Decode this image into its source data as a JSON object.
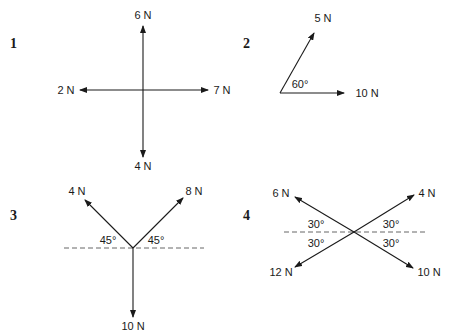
{
  "diagrams": [
    {
      "number": "1",
      "forces": {
        "up": "6 N",
        "left": "2 N",
        "right": "7 N",
        "down": "4 N"
      }
    },
    {
      "number": "2",
      "forces": {
        "angled": "5 N",
        "horizontal": "10 N"
      },
      "angle": "60°"
    },
    {
      "number": "3",
      "forces": {
        "upper_left": "4 N",
        "upper_right": "8 N",
        "down": "10 N"
      },
      "angles": {
        "left": "45°",
        "right": "45°"
      }
    },
    {
      "number": "4",
      "forces": {
        "upper_left": "6 N",
        "upper_right": "4 N",
        "lower_left": "12 N",
        "lower_right": "10 N"
      },
      "angles": {
        "upper_left": "30°",
        "upper_right": "30°",
        "lower_left": "30°",
        "lower_right": "30°"
      }
    }
  ]
}
